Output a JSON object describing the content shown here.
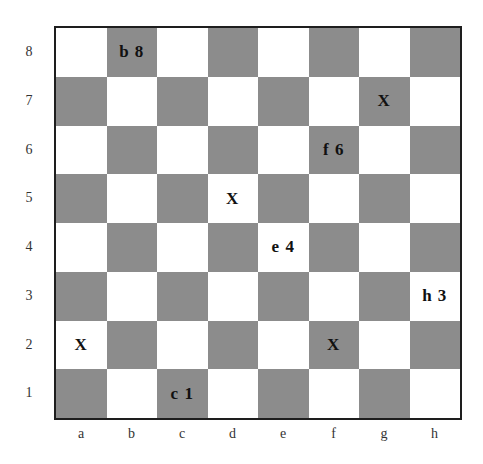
{
  "diagram": {
    "type": "chessboard",
    "colors": {
      "light": "#ffffff",
      "dark": "#8c8c8c",
      "border": "#1e1e1e"
    },
    "files": [
      "a",
      "b",
      "c",
      "d",
      "e",
      "f",
      "g",
      "h"
    ],
    "ranks": [
      "8",
      "7",
      "6",
      "5",
      "4",
      "3",
      "2",
      "1"
    ],
    "marks": {
      "b8": "b8",
      "g7": "X",
      "f6": "f6",
      "d5": "X",
      "e4": "e4",
      "h3": "h3",
      "a2": "X",
      "f2": "X",
      "c1": "c1"
    }
  }
}
